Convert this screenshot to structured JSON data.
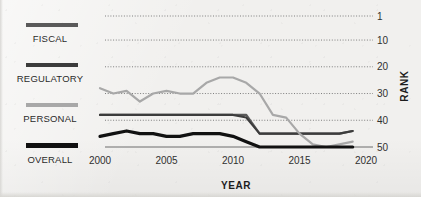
{
  "legend": {
    "items": [
      {
        "label": "FISCAL",
        "color": "#5a5a5a"
      },
      {
        "label": "REGULATORY",
        "color": "#3c3c3c"
      },
      {
        "label": "PERSONAL",
        "color": "#a8a8a8"
      },
      {
        "label": "OVERALL",
        "color": "#111111"
      }
    ]
  },
  "chart_data": {
    "type": "line",
    "title": "",
    "xlabel": "YEAR",
    "ylabel": "RANK",
    "xlim": [
      2000,
      2020
    ],
    "ylim": [
      1,
      50
    ],
    "y_inverted": true,
    "grid": true,
    "grid_style": "dotted",
    "xticks": [
      2000,
      2005,
      2010,
      2015,
      2020
    ],
    "yticks": [
      1,
      10,
      20,
      30,
      40,
      50
    ],
    "legend_position": "left",
    "x": [
      2000,
      2001,
      2002,
      2003,
      2004,
      2005,
      2006,
      2007,
      2008,
      2009,
      2010,
      2011,
      2012,
      2013,
      2014,
      2015,
      2016,
      2017,
      2018,
      2019
    ],
    "series": [
      {
        "name": "FISCAL",
        "color": "#5a5a5a",
        "values": [
          38,
          38,
          38,
          38,
          38,
          38,
          38,
          38,
          38,
          38,
          38,
          38,
          45,
          45,
          45,
          45,
          45,
          45,
          45,
          44
        ]
      },
      {
        "name": "REGULATORY",
        "color": "#3c3c3c",
        "values": [
          38,
          38,
          38,
          38,
          38,
          38,
          38,
          38,
          38,
          38,
          38,
          39,
          45,
          45,
          45,
          45,
          45,
          45,
          45,
          44
        ]
      },
      {
        "name": "PERSONAL",
        "color": "#a8a8a8",
        "values": [
          28,
          30,
          29,
          33,
          30,
          29,
          30,
          30,
          26,
          24,
          24,
          26,
          30,
          38,
          39,
          45,
          49,
          50,
          49,
          48
        ]
      },
      {
        "name": "OVERALL",
        "color": "#111111",
        "values": [
          46,
          45,
          44,
          45,
          45,
          46,
          46,
          45,
          45,
          45,
          46,
          48,
          50,
          50,
          50,
          50,
          50,
          50,
          50,
          50
        ]
      }
    ]
  }
}
